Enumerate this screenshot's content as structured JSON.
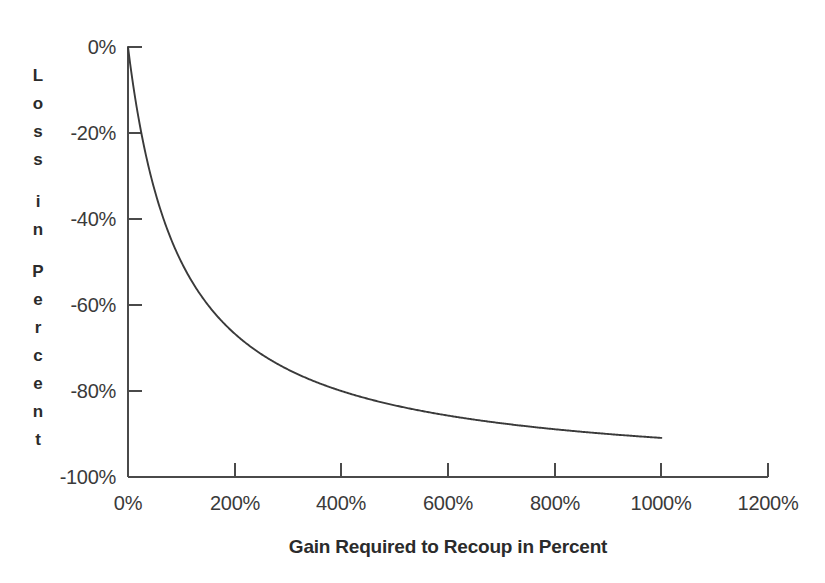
{
  "chart_data": {
    "type": "line",
    "title": "",
    "subtitle": "",
    "xlabel": "Gain Required to Recoup in Percent",
    "ylabel": "Loss in Percent",
    "ylabel_letters": [
      "L",
      "o",
      "s",
      "s",
      "",
      "i",
      "n",
      "",
      "P",
      "e",
      "r",
      "c",
      "e",
      "n",
      "t"
    ],
    "xlim": [
      0,
      1200
    ],
    "ylim": [
      -100,
      0
    ],
    "grid": false,
    "legend": "none",
    "line_color": "#3a3a3a",
    "axis_color": "#4a4a4a",
    "background_color": "#ffffff",
    "xticks": [
      0,
      200,
      400,
      600,
      800,
      1000,
      1200
    ],
    "xtick_labels": [
      "0%",
      "200%",
      "400%",
      "600%",
      "800%",
      "1000%",
      "1200%"
    ],
    "yticks": [
      0,
      -20,
      -40,
      -60,
      -80,
      -100
    ],
    "ytick_labels": [
      "0%",
      "-20%",
      "-40%",
      "-60%",
      "-80%",
      "-100%"
    ],
    "series": [
      {
        "name": "Loss vs gain required to recoup",
        "relation": "loss = -gain / (1 + gain)",
        "x": [
          0,
          10,
          20,
          30,
          40,
          50,
          60,
          70,
          80,
          90,
          100,
          125,
          150,
          175,
          200,
          233,
          250,
          300,
          350,
          400,
          450,
          500,
          567,
          600,
          650,
          700,
          750,
          800,
          850,
          900,
          900,
          950,
          1000
        ],
        "y": [
          0,
          -9.1,
          -16.7,
          -23.1,
          -28.6,
          -33.3,
          -37.5,
          -41.2,
          -44.4,
          -47.4,
          -50,
          -55.6,
          -60,
          -63.6,
          -66.7,
          -70,
          -71.4,
          -75,
          -77.8,
          -80,
          -81.8,
          -83.3,
          -85,
          -85.7,
          -86.7,
          -87.5,
          -88.2,
          -88.9,
          -89.5,
          -90,
          -90,
          -90.5,
          -90.9
        ]
      }
    ],
    "annotations": []
  },
  "axis_title_x": "Gain Required to Recoup in Percent"
}
